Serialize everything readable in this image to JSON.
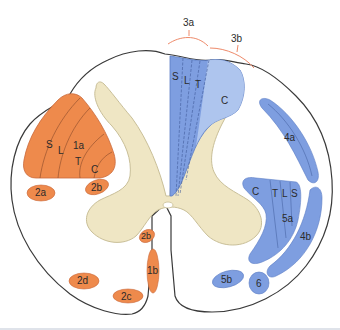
{
  "diagram": {
    "colors": {
      "outline": "#3a3a3a",
      "white_matter": "#ffffff",
      "gray_matter": "#efe6c4",
      "gray_matter_edge": "#c9bf98",
      "orange_fill": "#ee8a4c",
      "orange_edge": "#c9683a",
      "blue_fill": "#7e9ee0",
      "blue_light": "#b6cbf0",
      "blue_edge": "#5a7cc4",
      "bracket": "#ee8a6a"
    },
    "brackets": [
      {
        "id": "3a",
        "label": "3a"
      },
      {
        "id": "3b",
        "label": "3b"
      }
    ],
    "dorsal_column": {
      "sublabels": [
        "S",
        "L",
        "T",
        "C"
      ]
    },
    "left_triangle": {
      "sublabels": [
        "S",
        "L",
        "1a",
        "T",
        "C"
      ]
    },
    "orange_tracts": [
      {
        "id": "2a",
        "label": "2a"
      },
      {
        "id": "2b_upper",
        "label": "2b"
      },
      {
        "id": "2b_lower",
        "label": "2b"
      },
      {
        "id": "1b",
        "label": "1b"
      },
      {
        "id": "2c",
        "label": "2c"
      },
      {
        "id": "2d",
        "label": "2d"
      }
    ],
    "blue_tracts": [
      {
        "id": "4a",
        "label": "4a"
      },
      {
        "id": "4b",
        "label": "4b"
      },
      {
        "id": "5a",
        "label": "5a",
        "sublabels": [
          "C",
          "T",
          "L",
          "S"
        ]
      },
      {
        "id": "5b",
        "label": "5b"
      },
      {
        "id": "6",
        "label": "6"
      }
    ]
  }
}
